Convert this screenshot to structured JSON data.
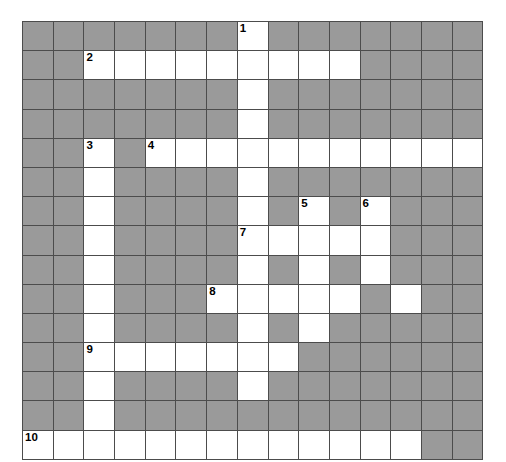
{
  "puzzle": {
    "title": "Crossword Grid",
    "rows": 15,
    "cols": 15,
    "colors": {
      "block": "#9a9a9a",
      "open": "#ffffff",
      "border": "#4c4c4c",
      "number": "#000000",
      "background": "#ffffff"
    },
    "cell_size_px": 30.7,
    "grid": [
      [
        0,
        0,
        0,
        0,
        0,
        0,
        0,
        1,
        0,
        0,
        0,
        0,
        0,
        0,
        0
      ],
      [
        0,
        0,
        1,
        1,
        1,
        1,
        1,
        1,
        1,
        1,
        1,
        0,
        0,
        0,
        0
      ],
      [
        0,
        0,
        0,
        0,
        0,
        0,
        0,
        1,
        0,
        0,
        0,
        0,
        0,
        0,
        0
      ],
      [
        0,
        0,
        0,
        0,
        0,
        0,
        0,
        1,
        0,
        0,
        0,
        0,
        0,
        0,
        0
      ],
      [
        0,
        0,
        1,
        0,
        1,
        1,
        1,
        1,
        1,
        1,
        1,
        1,
        1,
        1,
        1
      ],
      [
        0,
        0,
        1,
        0,
        0,
        0,
        0,
        1,
        0,
        0,
        0,
        0,
        0,
        0,
        0
      ],
      [
        0,
        0,
        1,
        0,
        0,
        0,
        0,
        1,
        0,
        1,
        0,
        1,
        0,
        0,
        0
      ],
      [
        0,
        0,
        1,
        0,
        0,
        0,
        0,
        1,
        1,
        1,
        1,
        1,
        0,
        0,
        0
      ],
      [
        0,
        0,
        1,
        0,
        0,
        0,
        0,
        1,
        0,
        1,
        0,
        1,
        0,
        0,
        0
      ],
      [
        0,
        0,
        1,
        0,
        0,
        0,
        1,
        1,
        1,
        1,
        1,
        0,
        1,
        0,
        0
      ],
      [
        0,
        0,
        1,
        0,
        0,
        0,
        0,
        1,
        0,
        1,
        0,
        0,
        0,
        0,
        0
      ],
      [
        0,
        0,
        1,
        1,
        1,
        1,
        1,
        1,
        1,
        0,
        0,
        0,
        0,
        0,
        0
      ],
      [
        0,
        0,
        1,
        0,
        0,
        0,
        0,
        1,
        0,
        0,
        0,
        0,
        0,
        0,
        0
      ],
      [
        0,
        0,
        1,
        0,
        0,
        0,
        0,
        0,
        0,
        0,
        0,
        0,
        0,
        0,
        0
      ],
      [
        1,
        1,
        1,
        1,
        1,
        1,
        1,
        1,
        1,
        1,
        1,
        1,
        1,
        0,
        0
      ]
    ],
    "numbers": [
      {
        "row": 0,
        "col": 7,
        "label": "1"
      },
      {
        "row": 1,
        "col": 2,
        "label": "2"
      },
      {
        "row": 4,
        "col": 2,
        "label": "3"
      },
      {
        "row": 4,
        "col": 4,
        "label": "4"
      },
      {
        "row": 6,
        "col": 9,
        "label": "5"
      },
      {
        "row": 6,
        "col": 11,
        "label": "6"
      },
      {
        "row": 7,
        "col": 7,
        "label": "7"
      },
      {
        "row": 9,
        "col": 6,
        "label": "8"
      },
      {
        "row": 11,
        "col": 2,
        "label": "9"
      },
      {
        "row": 14,
        "col": 0,
        "label": "10"
      }
    ]
  }
}
